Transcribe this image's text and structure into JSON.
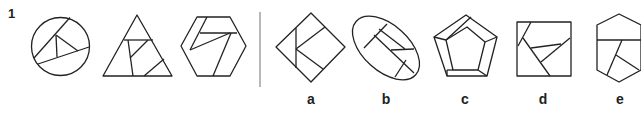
{
  "question": {
    "number": "1",
    "type": "odd-one-out / analogy puzzle",
    "given_figures": [
      {
        "shape": "circle",
        "description": "circle divided by chords with an inner triangle"
      },
      {
        "shape": "triangle",
        "description": "triangle divided with inner quadrilateral pieces"
      },
      {
        "shape": "hexagon",
        "description": "hexagon divided with diagonal segments"
      }
    ],
    "options": [
      {
        "label": "a",
        "shape": "diamond"
      },
      {
        "label": "b",
        "shape": "ellipse"
      },
      {
        "label": "c",
        "shape": "pentagon"
      },
      {
        "label": "d",
        "shape": "square"
      },
      {
        "label": "e",
        "shape": "hexagon"
      }
    ]
  },
  "colors": {
    "stroke": "#222222",
    "divider": "#888888",
    "background": "#ffffff"
  }
}
